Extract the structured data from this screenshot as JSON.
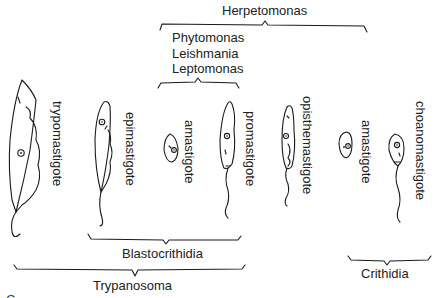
{
  "genera": {
    "herpetomonas": "Herpetomonas",
    "leishmania_group": [
      "Phytomonas",
      "Leishmania",
      "Leptomonas"
    ],
    "blastocrithidia": "Blastocrithidia",
    "trypanosoma": "Trypanosoma",
    "crithidia": "Crithidia"
  },
  "forms": [
    {
      "id": "trypomastigote",
      "label": "trypomastigote"
    },
    {
      "id": "epimastigote",
      "label": "epimastigote"
    },
    {
      "id": "amastigote-1",
      "label": "amastigote"
    },
    {
      "id": "promastigote",
      "label": "promastigote"
    },
    {
      "id": "opisthomastigote",
      "label": "opisthemastigote"
    },
    {
      "id": "amastigote-2",
      "label": "amastigote"
    },
    {
      "id": "choanomastigote",
      "label": "choanomastigote"
    }
  ],
  "footer_cut_text": "C. ..."
}
